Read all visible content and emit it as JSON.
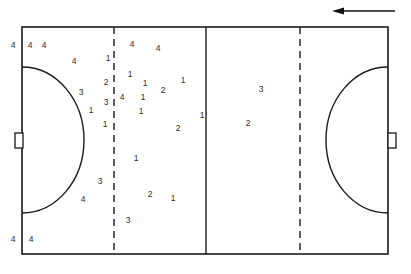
{
  "diagram": {
    "direction_arrow": {
      "name": "direction-of-play-arrow",
      "points": "left",
      "x1": 395,
      "y1": 11,
      "x2": 332,
      "y2": 11
    },
    "pitch": {
      "left": 22,
      "top": 27,
      "right": 388,
      "bottom": 254,
      "stroke": "#1a1a1a",
      "line_width": 1.6,
      "background": "#ffffff"
    },
    "center_line": {
      "name": "halfway-line",
      "x": 206,
      "style": "solid"
    },
    "dashed_lines": [
      {
        "name": "twenty-three-metre-line-left",
        "x": 114,
        "style": "dashed"
      },
      {
        "name": "twenty-three-metre-line-right",
        "x": 300,
        "style": "dashed"
      }
    ],
    "shooting_circles": [
      {
        "name": "shooting-circle-left",
        "side": "left",
        "cx": 22,
        "cy": 140,
        "rx": 62,
        "ry": 73
      },
      {
        "name": "shooting-circle-right",
        "side": "right",
        "cx": 388,
        "cy": 140,
        "rx": 62,
        "ry": 73
      }
    ],
    "goals": [
      {
        "name": "goal-left",
        "side": "left",
        "x": 15,
        "y": 133,
        "w": 8,
        "h": 15
      },
      {
        "name": "goal-right",
        "side": "right",
        "x": 388,
        "y": 133,
        "w": 8,
        "h": 15
      }
    ],
    "colors": {
      "line": "#1a1a1a",
      "marker_text": "#2b2b2b",
      "arrow": "#111111",
      "background": "#ffffff"
    },
    "legend_note": "",
    "markers": [
      {
        "label": "4",
        "x": 13,
        "y": 45
      },
      {
        "label": "4",
        "x": 30,
        "y": 45
      },
      {
        "label": "4",
        "x": 44,
        "y": 45
      },
      {
        "label": "4",
        "x": 74,
        "y": 61
      },
      {
        "label": "1",
        "x": 108,
        "y": 58
      },
      {
        "label": "4",
        "x": 132,
        "y": 44
      },
      {
        "label": "4",
        "x": 158,
        "y": 48
      },
      {
        "label": "1",
        "x": 130,
        "y": 74
      },
      {
        "label": "2",
        "x": 106,
        "y": 82
      },
      {
        "label": "1",
        "x": 145,
        "y": 83
      },
      {
        "label": "1",
        "x": 183,
        "y": 80
      },
      {
        "label": "3",
        "x": 81,
        "y": 92
      },
      {
        "label": "3",
        "x": 106,
        "y": 102
      },
      {
        "label": "4",
        "x": 122,
        "y": 97
      },
      {
        "label": "1",
        "x": 143,
        "y": 97
      },
      {
        "label": "2",
        "x": 163,
        "y": 90
      },
      {
        "label": "3",
        "x": 261,
        "y": 89
      },
      {
        "label": "1",
        "x": 91,
        "y": 110
      },
      {
        "label": "1",
        "x": 141,
        "y": 111
      },
      {
        "label": "2",
        "x": 178,
        "y": 128
      },
      {
        "label": "1",
        "x": 202,
        "y": 115
      },
      {
        "label": "2",
        "x": 248,
        "y": 123
      },
      {
        "label": "1",
        "x": 105,
        "y": 124
      },
      {
        "label": "1",
        "x": 136,
        "y": 158
      },
      {
        "label": "3",
        "x": 100,
        "y": 181
      },
      {
        "label": "2",
        "x": 150,
        "y": 194
      },
      {
        "label": "1",
        "x": 173,
        "y": 198
      },
      {
        "label": "4",
        "x": 83,
        "y": 199
      },
      {
        "label": "3",
        "x": 128,
        "y": 220
      },
      {
        "label": "4",
        "x": 13,
        "y": 239
      },
      {
        "label": "4",
        "x": 31,
        "y": 239
      }
    ]
  }
}
